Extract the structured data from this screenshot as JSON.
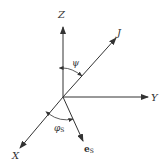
{
  "diagram": {
    "type": "3d-coordinate-axes",
    "line_color": "#333333",
    "background": "#ffffff",
    "axes": [
      {
        "id": "Z",
        "label": "Z"
      },
      {
        "id": "Y",
        "label": "Y"
      },
      {
        "id": "X",
        "label": "X"
      },
      {
        "id": "J",
        "label": "J"
      },
      {
        "id": "eS",
        "label": "e",
        "subscript": "S"
      }
    ],
    "angles": [
      {
        "id": "psi",
        "label": "ψ",
        "between": [
          "Z",
          "J"
        ]
      },
      {
        "id": "phiS",
        "label": "φ",
        "subscript": "S",
        "between": [
          "X",
          "eS"
        ]
      }
    ]
  }
}
